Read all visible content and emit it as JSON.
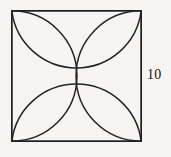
{
  "figure": {
    "background_color": "#f6f5f3",
    "stroke_color": "#242424",
    "square": {
      "side_label": "10",
      "side_length": 10,
      "x": 11,
      "y": 10,
      "width": 130,
      "height": 131
    },
    "labels": {
      "right_side": "10"
    },
    "center_point": {
      "x": 76,
      "y": 75.5
    },
    "petals": [
      {
        "name": "top-left-petal",
        "orientation": "corner-to-center",
        "corner": "top-left"
      },
      {
        "name": "top-right-petal",
        "orientation": "corner-to-center",
        "corner": "top-right"
      },
      {
        "name": "bottom-left-petal",
        "orientation": "corner-to-center",
        "corner": "bottom-left"
      },
      {
        "name": "bottom-right-petal",
        "orientation": "corner-to-center",
        "corner": "bottom-right"
      }
    ],
    "arcs": [
      {
        "name": "arc-top-side",
        "from": "top-left-corner",
        "to": "top-right-corner",
        "bulge": "downward-through-center"
      },
      {
        "name": "arc-bottom-side",
        "from": "bottom-left-corner",
        "to": "bottom-right-corner",
        "bulge": "upward-through-center"
      },
      {
        "name": "arc-left-side",
        "from": "top-left-corner",
        "to": "bottom-left-corner",
        "bulge": "rightward-through-center"
      },
      {
        "name": "arc-right-side",
        "from": "top-right-corner",
        "to": "bottom-right-corner",
        "bulge": "leftward-through-center"
      }
    ]
  }
}
